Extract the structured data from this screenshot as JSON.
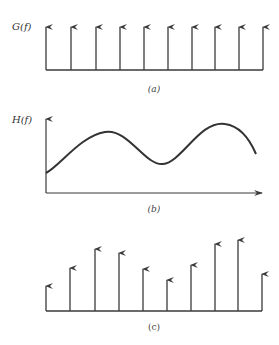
{
  "panels": {
    "a": {
      "ylabel": "G(f)",
      "caption": "(a)",
      "baseline_y": 70,
      "x_start": 46,
      "x_end": 263,
      "impulses": [
        {
          "x": 46,
          "top": 27
        },
        {
          "x": 71,
          "top": 27
        },
        {
          "x": 96,
          "top": 27
        },
        {
          "x": 120,
          "top": 27
        },
        {
          "x": 144,
          "top": 27
        },
        {
          "x": 168,
          "top": 27
        },
        {
          "x": 192,
          "top": 27
        },
        {
          "x": 215,
          "top": 27
        },
        {
          "x": 239,
          "top": 27
        },
        {
          "x": 263,
          "top": 27
        }
      ]
    },
    "b": {
      "ylabel": "H(f)",
      "caption": "(b)",
      "axis_origin": [
        46,
        193
      ],
      "axis_y_top": 119,
      "axis_x_end": 262,
      "curve_path": "M46,173 C60,166 80,136 105,132 C128,128 145,166 163,164 C182,162 200,120 225,124 C240,126 250,140 256,154"
    },
    "c": {
      "caption": "(c)",
      "baseline_y": 311,
      "x_start": 46,
      "x_end": 262,
      "impulses": [
        {
          "x": 46,
          "top": 286
        },
        {
          "x": 70,
          "top": 268
        },
        {
          "x": 95,
          "top": 249
        },
        {
          "x": 119,
          "top": 253
        },
        {
          "x": 143,
          "top": 269
        },
        {
          "x": 167,
          "top": 280
        },
        {
          "x": 191,
          "top": 265
        },
        {
          "x": 215,
          "top": 244
        },
        {
          "x": 238,
          "top": 240
        },
        {
          "x": 262,
          "top": 274
        }
      ]
    }
  },
  "colors": {
    "stroke": "#3a3a3a"
  }
}
